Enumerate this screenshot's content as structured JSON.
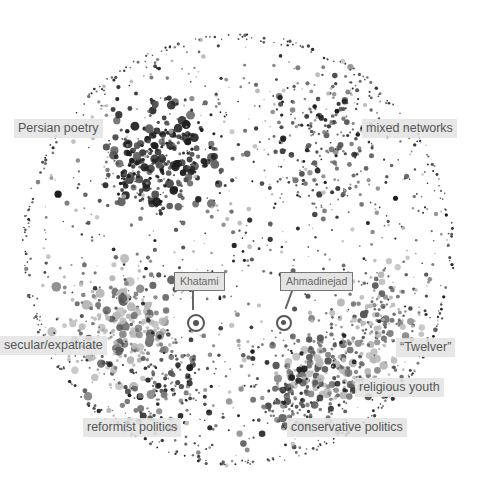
{
  "map": {
    "center": [
      238,
      250
    ],
    "radius": 216,
    "dot_colors": {
      "dark": "#1e1e1e",
      "mid": "#555555",
      "gray": "#7a7a7a",
      "light": "#b8b8b8"
    },
    "clusters": [
      {
        "name": "persian-poetry",
        "cx": 160,
        "cy": 160,
        "spread": 55,
        "count": 260,
        "size": [
          1.5,
          4.5
        ],
        "tones": [
          "dark",
          "dark",
          "mid"
        ]
      },
      {
        "name": "mixed-networks",
        "cx": 330,
        "cy": 140,
        "spread": 70,
        "count": 200,
        "size": [
          1,
          3.2
        ],
        "tones": [
          "dark",
          "mid",
          "gray"
        ]
      },
      {
        "name": "secular-expatriate",
        "cx": 120,
        "cy": 330,
        "spread": 55,
        "count": 220,
        "size": [
          1.5,
          5
        ],
        "tones": [
          "light",
          "light",
          "gray",
          "mid"
        ]
      },
      {
        "name": "twelver",
        "cx": 380,
        "cy": 320,
        "spread": 45,
        "count": 140,
        "size": [
          1.2,
          4
        ],
        "tones": [
          "light",
          "gray",
          "mid"
        ]
      },
      {
        "name": "religious-youth",
        "cx": 330,
        "cy": 370,
        "spread": 45,
        "count": 150,
        "size": [
          1.5,
          4.5
        ],
        "tones": [
          "gray",
          "mid",
          "light"
        ]
      },
      {
        "name": "reformist-politics",
        "cx": 170,
        "cy": 390,
        "spread": 45,
        "count": 110,
        "size": [
          1.2,
          3.5
        ],
        "tones": [
          "gray",
          "mid",
          "dark"
        ]
      },
      {
        "name": "conservative-politics",
        "cx": 290,
        "cy": 400,
        "spread": 45,
        "count": 120,
        "size": [
          1.2,
          3.8
        ],
        "tones": [
          "mid",
          "gray",
          "dark"
        ]
      },
      {
        "name": "background",
        "cx": 238,
        "cy": 250,
        "spread": 216,
        "count": 900,
        "size": [
          0.8,
          2.6
        ],
        "tones": [
          "dark",
          "mid",
          "gray",
          "light"
        ]
      },
      {
        "name": "rim",
        "cx": 238,
        "cy": 250,
        "spread": 216,
        "count": 260,
        "size": [
          0.8,
          1.8
        ],
        "tones": [
          "dark",
          "mid"
        ],
        "rim": true
      }
    ]
  },
  "labels": [
    {
      "id": "persian-poetry",
      "text": "Persian poetry",
      "x": 14,
      "y": 119
    },
    {
      "id": "mixed-networks",
      "text": "mixed networks",
      "x": 362,
      "y": 119
    },
    {
      "id": "secular-expatriate",
      "text": "secular/expatriate",
      "x": 0,
      "y": 336
    },
    {
      "id": "twelver",
      "text": "“Twelver”",
      "x": 396,
      "y": 338
    },
    {
      "id": "religious-youth",
      "text": "religious youth",
      "x": 355,
      "y": 378
    },
    {
      "id": "reformist-politics",
      "text": "reformist politics",
      "x": 83,
      "y": 418
    },
    {
      "id": "conservative-politics",
      "text": "conservative politics",
      "x": 287,
      "y": 418
    }
  ],
  "callouts": [
    {
      "id": "khatami",
      "text": "Khatami",
      "box_x": 174,
      "box_y": 272,
      "line_x": 193,
      "line_y1": 291,
      "line_y2": 310,
      "ring_cx": 196,
      "ring_cy": 323,
      "ring_r": 9
    },
    {
      "id": "ahmadinejad",
      "text": "Ahmadinejad",
      "box_x": 280,
      "box_y": 272,
      "line_x": 294,
      "line_y1": 291,
      "line_y2": 310,
      "ring_cx": 284,
      "ring_cy": 323,
      "ring_r": 8
    }
  ]
}
